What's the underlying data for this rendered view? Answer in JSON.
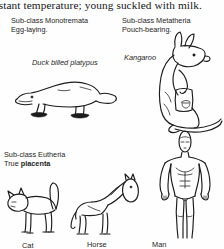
{
  "page": {
    "width": 224,
    "height": 249,
    "background_color": "#fefefe",
    "ink_color": "#1b1b1b"
  },
  "header": {
    "text": "nstant temperature; young suckled with milk.",
    "clipped_left": true
  },
  "subclasses": [
    {
      "id": "monotremata",
      "line1": "Sub-class Monotremata",
      "line2": "Egg-laying.",
      "bold_word": ""
    },
    {
      "id": "metatheria",
      "line1": "Sub-class Metatheria",
      "line2": "Pouch-bearing.",
      "bold_word": ""
    },
    {
      "id": "eutheria",
      "line1": "Sub-class Eutheria",
      "line2_prefix": "True ",
      "bold_word": "placenta"
    }
  ],
  "figures": [
    {
      "id": "platypus",
      "label": "Duck billed platypus",
      "label_style": "italic",
      "icon": "platypus-line-drawing"
    },
    {
      "id": "kangaroo",
      "label": "Kangaroo",
      "label_style": "italic",
      "icon": "kangaroo-line-drawing"
    },
    {
      "id": "cat",
      "label": "Cat",
      "label_style": "normal",
      "icon": "cat-line-drawing"
    },
    {
      "id": "horse",
      "label": "Horse",
      "label_style": "normal",
      "icon": "horse-line-drawing"
    },
    {
      "id": "man",
      "label": "Man",
      "label_style": "normal",
      "icon": "human-figure-line-drawing"
    }
  ]
}
